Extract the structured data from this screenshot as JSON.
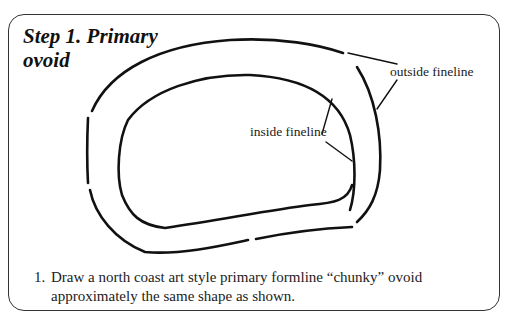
{
  "title": {
    "line1": "Step 1. Primary",
    "line2": "ovoid"
  },
  "diagram": {
    "labels": {
      "outside": "outside fineline",
      "inside": "inside fineline"
    },
    "stroke_color": "#111111"
  },
  "instructions": [
    {
      "number": "1.",
      "line1": "Draw a north coast art style primary formline “chunky” ovoid",
      "line2": "approximately the same shape as shown."
    }
  ]
}
